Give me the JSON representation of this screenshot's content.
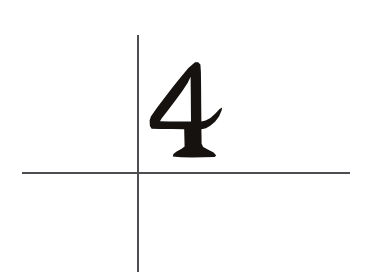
{
  "canvas": {
    "width": 367,
    "height": 279,
    "background_color": "#ffffff",
    "description": "Handwritten digit four on white paper with two crossing reference rule lines"
  },
  "annotation": {
    "digit_label": "4",
    "digit_color": "#15120f",
    "style": "handwritten-calligraphic",
    "quadrant": "upper-right",
    "bbox": {
      "x": 150,
      "y": 62,
      "width": 72,
      "height": 96
    }
  },
  "guides": {
    "line_color": "#4d4d52",
    "line_width": 1.5,
    "vertical": {
      "name": "vertical-rule",
      "x": 138,
      "y_start": 35,
      "y_end": 272
    },
    "horizontal": {
      "name": "horizontal-rule",
      "y": 173,
      "x_start": 22,
      "x_end": 350
    },
    "intersection": {
      "x": 138,
      "y": 173
    }
  },
  "glyph_path": {
    "outline": "M 195.0 62.2 L 188.4 68.0 L 181.5 76.3 L 173.2 86.6 L 164.0 98.4 L 156.6 108.2 L 150.9 116.6 L 149.6 120.5 L 149.9 126.0 L 151.6 128.8 L 160.0 129.0 L 172.0 129.1 L 184.2 129.2 L 184.4 138.0 L 184.6 146.4 L 181.6 148.8 L 176.6 151.4 L 173.4 154.0 L 172.8 156.6 L 181.0 157.2 L 192.0 157.4 L 204.0 157.3 L 214.6 157.0 L 216.2 155.4 L 213.6 152.4 L 207.8 149.6 L 203.2 147.0 L 201.6 143.8 L 201.5 136.0 L 201.4 129.2 L 206.0 128.2 L 210.6 125.6 L 215.0 121.8 L 219.0 116.4 L 221.6 110.4 L 222.2 107.4 L 219.6 109.0 L 215.4 113.6 L 210.4 118.0 L 205.6 120.6 L 201.4 121.4 L 201.2 104.0 L 201.1 86.0 L 200.9 72.0 L 200.4 64.6 L 198.2 62.2 Z",
    "counter": "M 190.6 76.8 L 190.8 94.0 L 190.9 110.0 L 191.0 121.6 L 180.0 121.5 L 169.0 121.4 L 160.0 121.3 L 161.6 118.6 L 167.8 110.4 L 175.0 101.0 L 182.0 91.4 L 187.6 83.0 Z"
  },
  "ink": {
    "foot_serif": {
      "name": "foot-serif",
      "present": true
    },
    "crossbar_hook": {
      "name": "crossbar-hook",
      "present": true
    },
    "apex": {
      "name": "apex-point",
      "present": true
    }
  }
}
